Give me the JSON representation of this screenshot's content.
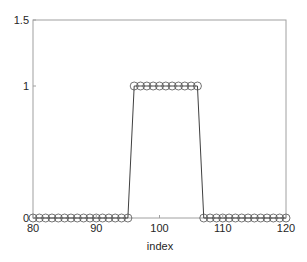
{
  "chart_data": {
    "type": "line",
    "title": "",
    "xlabel": "index",
    "ylabel": "",
    "xlim": [
      80,
      120
    ],
    "ylim": [
      0,
      1.5
    ],
    "xticks": [
      80,
      90,
      100,
      110,
      120
    ],
    "yticks": [
      0,
      1,
      1.5
    ],
    "xtick_labels": [
      "80",
      "90",
      "100",
      "110",
      "120"
    ],
    "ytick_labels": [
      "0",
      "1",
      "1.5"
    ],
    "grid": false,
    "legend": null,
    "marker": "open-circle",
    "line_color": "#404040",
    "series": [
      {
        "name": "signal",
        "x": [
          80,
          81,
          82,
          83,
          84,
          85,
          86,
          87,
          88,
          89,
          90,
          91,
          92,
          93,
          94,
          95,
          96,
          97,
          98,
          99,
          100,
          101,
          102,
          103,
          104,
          105,
          106,
          107,
          108,
          109,
          110,
          111,
          112,
          113,
          114,
          115,
          116,
          117,
          118,
          119,
          120
        ],
        "values": [
          0,
          0,
          0,
          0,
          0,
          0,
          0,
          0,
          0,
          0,
          0,
          0,
          0,
          0,
          0,
          0,
          1,
          1,
          1,
          1,
          1,
          1,
          1,
          1,
          1,
          1,
          1,
          0,
          0,
          0,
          0,
          0,
          0,
          0,
          0,
          0,
          0,
          0,
          0,
          0,
          0
        ]
      }
    ]
  }
}
